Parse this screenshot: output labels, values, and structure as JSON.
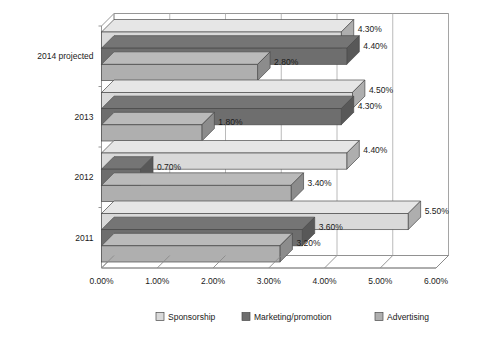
{
  "chart_data": {
    "type": "bar",
    "orientation": "horizontal",
    "title": "",
    "subtitle": "",
    "xlabel": "",
    "ylabel": "",
    "xlim": [
      0,
      6
    ],
    "xticks": [
      0,
      1,
      2,
      3,
      4,
      5,
      6
    ],
    "xtick_labels": [
      "0.00%",
      "1.00%",
      "2.00%",
      "3.00%",
      "4.00%",
      "5.00%",
      "6.00%"
    ],
    "categories": [
      "2014 projected",
      "2013",
      "2012",
      "2011"
    ],
    "grid": true,
    "legend_position": "bottom",
    "series": [
      {
        "name": "Sponsorship",
        "color": "#d9d9d9",
        "values": [
          4.3,
          4.5,
          4.4,
          5.5
        ],
        "labels": [
          "4.30%",
          "4.50%",
          "4.40%",
          "5.50%"
        ]
      },
      {
        "name": "Marketing/promotion",
        "color": "#6e6e6e",
        "values": [
          4.4,
          4.3,
          0.7,
          3.6
        ],
        "labels": [
          "4.40%",
          "4.30%",
          "0.70%",
          "3.60%"
        ]
      },
      {
        "name": "Advertising",
        "color": "#afafaf",
        "values": [
          2.8,
          1.8,
          3.4,
          3.2
        ],
        "labels": [
          "2.80%",
          "1.80%",
          "3.40%",
          "3.20%"
        ]
      }
    ]
  },
  "legend": {
    "items": [
      {
        "label": "Sponsorship",
        "color": "#d9d9d9"
      },
      {
        "label": "Marketing/promotion",
        "color": "#6e6e6e"
      },
      {
        "label": "Advertising",
        "color": "#afafaf"
      }
    ]
  },
  "axis": {
    "x_tick_labels": [
      "0.00%",
      "1.00%",
      "2.00%",
      "3.00%",
      "4.00%",
      "5.00%",
      "6.00%"
    ],
    "y_tick_labels": [
      "2014 projected",
      "2013",
      "2012",
      "2011"
    ]
  }
}
